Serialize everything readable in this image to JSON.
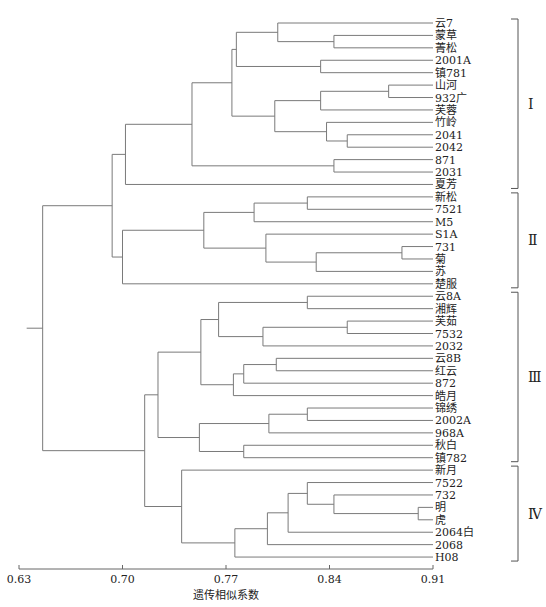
{
  "diagram": {
    "type": "dendrogram",
    "axis": {
      "title": "遗传相似系数",
      "ticks": [
        "0.63",
        "0.70",
        "0.77",
        "0.84",
        "0.91"
      ],
      "tick_values": [
        0.63,
        0.7,
        0.77,
        0.84,
        0.91
      ]
    },
    "leaves": [
      "云7",
      "蒙草",
      "菁松",
      "2001A",
      "镇781",
      "山河",
      "932广",
      "芙蓉",
      "竹岭",
      "2041",
      "2042",
      "871",
      "2031",
      "夏芳",
      "新松",
      "7521",
      "M5",
      "S1A",
      "731",
      "菊",
      "苏",
      "楚服",
      "云8A",
      "湘辉",
      "芙茹",
      "7532",
      "2032",
      "云8B",
      "红云",
      "872",
      "皓月",
      "锦绣",
      "2002A",
      "968A",
      "秋白",
      "镇782",
      "新月",
      "7522",
      "732",
      "明",
      "虎",
      "2064白",
      "2068",
      "H08"
    ],
    "groups": [
      {
        "label": "Ⅰ",
        "first": 0,
        "last": 13
      },
      {
        "label": "Ⅱ",
        "first": 14,
        "last": 21
      },
      {
        "label": "Ⅲ",
        "first": 22,
        "last": 35
      },
      {
        "label": "Ⅳ",
        "first": 36,
        "last": 43
      }
    ],
    "merges": [
      {
        "id": "a1",
        "left": 1,
        "right": 2,
        "sim": 0.843
      },
      {
        "id": "a2",
        "left": 0,
        "right": "a1",
        "sim": 0.805
      },
      {
        "id": "a3",
        "left": 3,
        "right": 4,
        "sim": 0.834
      },
      {
        "id": "a4",
        "left": "a2",
        "right": "a3",
        "sim": 0.777
      },
      {
        "id": "a5",
        "left": 5,
        "right": 6,
        "sim": 0.88
      },
      {
        "id": "a6",
        "left": "a5",
        "right": 7,
        "sim": 0.834
      },
      {
        "id": "a7",
        "left": 9,
        "right": 10,
        "sim": 0.852
      },
      {
        "id": "a8",
        "left": 8,
        "right": "a7",
        "sim": 0.838
      },
      {
        "id": "a9",
        "left": "a6",
        "right": "a8",
        "sim": 0.803
      },
      {
        "id": "a10",
        "left": "a4",
        "right": "a9",
        "sim": 0.774
      },
      {
        "id": "a11",
        "left": 11,
        "right": 12,
        "sim": 0.843
      },
      {
        "id": "a12",
        "left": "a10",
        "right": "a11",
        "sim": 0.747
      },
      {
        "id": "a13",
        "left": "a12",
        "right": 13,
        "sim": 0.702
      },
      {
        "id": "b1",
        "left": 14,
        "right": 15,
        "sim": 0.825
      },
      {
        "id": "b2",
        "left": "b1",
        "right": 16,
        "sim": 0.789
      },
      {
        "id": "b3",
        "left": 18,
        "right": 19,
        "sim": 0.889
      },
      {
        "id": "b4",
        "left": "b3",
        "right": 20,
        "sim": 0.831
      },
      {
        "id": "b5",
        "left": 17,
        "right": "b4",
        "sim": 0.797
      },
      {
        "id": "b6",
        "left": "b2",
        "right": "b5",
        "sim": 0.755
      },
      {
        "id": "b7",
        "left": "b6",
        "right": 21,
        "sim": 0.7
      },
      {
        "id": "c1",
        "left": "a13",
        "right": "b7",
        "sim": 0.693
      },
      {
        "id": "d1",
        "left": 22,
        "right": 23,
        "sim": 0.825
      },
      {
        "id": "d2",
        "left": 24,
        "right": 25,
        "sim": 0.852
      },
      {
        "id": "d3",
        "left": "d2",
        "right": 26,
        "sim": 0.795
      },
      {
        "id": "d4",
        "left": "d1",
        "right": "d3",
        "sim": 0.765
      },
      {
        "id": "d5",
        "left": 27,
        "right": 28,
        "sim": 0.804
      },
      {
        "id": "d6",
        "left": "d5",
        "right": 29,
        "sim": 0.782
      },
      {
        "id": "d7",
        "left": "d6",
        "right": 30,
        "sim": 0.775
      },
      {
        "id": "d8",
        "left": "d4",
        "right": "d7",
        "sim": 0.753
      },
      {
        "id": "d9",
        "left": 31,
        "right": 32,
        "sim": 0.825
      },
      {
        "id": "d10",
        "left": "d9",
        "right": 33,
        "sim": 0.799
      },
      {
        "id": "d11",
        "left": 34,
        "right": 35,
        "sim": 0.782
      },
      {
        "id": "d12",
        "left": "d10",
        "right": "d11",
        "sim": 0.752
      },
      {
        "id": "d13",
        "left": "d8",
        "right": "d12",
        "sim": 0.724
      },
      {
        "id": "e1",
        "left": 39,
        "right": 40,
        "sim": 0.9
      },
      {
        "id": "e2",
        "left": 38,
        "right": "e1",
        "sim": 0.843
      },
      {
        "id": "e3",
        "left": 37,
        "right": "e2",
        "sim": 0.825
      },
      {
        "id": "e4",
        "left": "e3",
        "right": 41,
        "sim": 0.812
      },
      {
        "id": "e5",
        "left": "e4",
        "right": 42,
        "sim": 0.798
      },
      {
        "id": "e6",
        "left": "e5",
        "right": 43,
        "sim": 0.776
      },
      {
        "id": "e7",
        "left": 36,
        "right": "e6",
        "sim": 0.74
      },
      {
        "id": "f1",
        "left": "d13",
        "right": "e7",
        "sim": 0.715
      },
      {
        "id": "root",
        "left": "c1",
        "right": "f1",
        "sim": 0.646
      }
    ]
  }
}
